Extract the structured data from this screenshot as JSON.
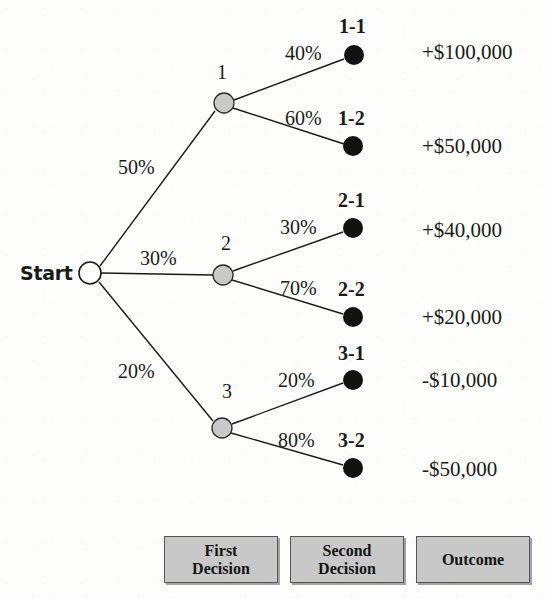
{
  "diagram": {
    "background_color": "#fdfdfc",
    "line_color": "#1a1a1a",
    "root": {
      "label": "Start",
      "node_type": "start",
      "fill": "#ffffff",
      "x": 90,
      "y": 273,
      "r": 11
    },
    "decision_nodes": [
      {
        "label": "1",
        "fill": "#c9c9c9",
        "x": 224,
        "y": 103,
        "r": 10,
        "label_x": 217,
        "label_y": 62
      },
      {
        "label": "2",
        "fill": "#c9c9c9",
        "x": 223,
        "y": 275,
        "r": 10,
        "label_x": 221,
        "label_y": 233
      },
      {
        "label": "3",
        "fill": "#c9c9c9",
        "x": 222,
        "y": 428,
        "r": 10,
        "label_x": 222,
        "label_y": 381
      }
    ],
    "terminal_nodes": [
      {
        "label": "1-1",
        "fill": "#111111",
        "x": 354,
        "y": 55,
        "r": 10,
        "label_x": 339,
        "label_y": 16
      },
      {
        "label": "1-2",
        "fill": "#111111",
        "x": 353,
        "y": 146,
        "r": 10,
        "label_x": 338,
        "label_y": 108
      },
      {
        "label": "2-1",
        "fill": "#111111",
        "x": 353,
        "y": 228,
        "r": 10,
        "label_x": 338,
        "label_y": 190
      },
      {
        "label": "2-2",
        "fill": "#111111",
        "x": 353,
        "y": 317,
        "r": 10,
        "label_x": 338,
        "label_y": 279
      },
      {
        "label": "3-1",
        "fill": "#111111",
        "x": 353,
        "y": 380,
        "r": 10,
        "label_x": 338,
        "label_y": 343
      },
      {
        "label": "3-2",
        "fill": "#111111",
        "x": 353,
        "y": 468,
        "r": 10,
        "label_x": 338,
        "label_y": 430
      }
    ],
    "branches": [
      {
        "from": "Start",
        "to": "1",
        "probability": "50%",
        "x1": 100,
        "y1": 266,
        "x2": 215,
        "y2": 111,
        "label_x": 118,
        "label_y": 157
      },
      {
        "from": "Start",
        "to": "2",
        "probability": "30%",
        "x1": 101,
        "y1": 273,
        "x2": 213,
        "y2": 275,
        "label_x": 140,
        "label_y": 248
      },
      {
        "from": "Start",
        "to": "3",
        "probability": "20%",
        "x1": 99,
        "y1": 282,
        "x2": 213,
        "y2": 421,
        "label_x": 118,
        "label_y": 361
      },
      {
        "from": "1",
        "to": "1-1",
        "probability": "40%",
        "x1": 234,
        "y1": 100,
        "x2": 344,
        "y2": 59,
        "label_x": 285,
        "label_y": 43
      },
      {
        "from": "1",
        "to": "1-2",
        "probability": "60%",
        "x1": 233,
        "y1": 108,
        "x2": 344,
        "y2": 144,
        "label_x": 285,
        "label_y": 108
      },
      {
        "from": "2",
        "to": "2-1",
        "probability": "30%",
        "x1": 233,
        "y1": 271,
        "x2": 343,
        "y2": 232,
        "label_x": 280,
        "label_y": 217
      },
      {
        "from": "2",
        "to": "2-2",
        "probability": "70%",
        "x1": 232,
        "y1": 280,
        "x2": 343,
        "y2": 314,
        "label_x": 280,
        "label_y": 278
      },
      {
        "from": "3",
        "to": "3-1",
        "probability": "20%",
        "x1": 232,
        "y1": 424,
        "x2": 343,
        "y2": 383,
        "label_x": 278,
        "label_y": 370
      },
      {
        "from": "3",
        "to": "3-2",
        "probability": "80%",
        "x1": 231,
        "y1": 433,
        "x2": 343,
        "y2": 465,
        "label_x": 278,
        "label_y": 430
      }
    ],
    "payoffs": [
      {
        "node": "1-1",
        "value": "+$100,000",
        "x": 422,
        "y": 42
      },
      {
        "node": "1-2",
        "value": "+$50,000",
        "x": 422,
        "y": 136
      },
      {
        "node": "2-1",
        "value": "+$40,000",
        "x": 422,
        "y": 220
      },
      {
        "node": "2-2",
        "value": "+$20,000",
        "x": 422,
        "y": 307
      },
      {
        "node": "3-1",
        "value": "-$10,000",
        "x": 422,
        "y": 370
      },
      {
        "node": "3-2",
        "value": "-$50,000",
        "x": 422,
        "y": 459
      }
    ],
    "legend": {
      "fill": "#c8c8c8",
      "border_color": "#55565a",
      "items": [
        {
          "line1": "First",
          "line2": "Decision",
          "x": 164,
          "y": 536,
          "w": 112,
          "h": 45
        },
        {
          "line1": "Second",
          "line2": "Decision",
          "x": 290,
          "y": 536,
          "w": 112,
          "h": 45
        },
        {
          "line1": "Outcome",
          "line2": "",
          "x": 416,
          "y": 536,
          "w": 112,
          "h": 45
        }
      ]
    }
  }
}
